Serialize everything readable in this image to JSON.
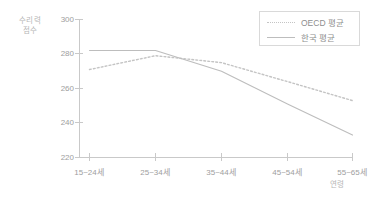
{
  "chart_data": {
    "type": "line",
    "title": "",
    "xlabel": "연령",
    "ylabel": "수리력 점수",
    "ylabel_line1": "수리력",
    "ylabel_line2": "점수",
    "categories": [
      "15~24세",
      "25~34세",
      "35~44세",
      "45~54세",
      "55~65세"
    ],
    "series": [
      {
        "name": "OECD 평균",
        "style": "dotted",
        "color": "#c4c4c4",
        "values": [
          271,
          279,
          275,
          264,
          253
        ]
      },
      {
        "name": "한국 평균",
        "style": "solid",
        "color": "#bdbdbd",
        "values": [
          282,
          282,
          270,
          251,
          233
        ]
      }
    ],
    "ylim": [
      220,
      300
    ],
    "yticks": [
      300,
      280,
      260,
      240,
      220
    ],
    "grid": false,
    "legend_position": "top-right"
  },
  "legend": {
    "items": [
      {
        "label": "OECD 평균"
      },
      {
        "label": "한국 평균"
      }
    ]
  },
  "colors": {
    "axis": "#c9c9c9",
    "text": "#9a9a9a",
    "oecd": "#c4c4c4",
    "korea": "#bdbdbd",
    "legend_border": "#d9d9d9",
    "background": "#ffffff"
  }
}
